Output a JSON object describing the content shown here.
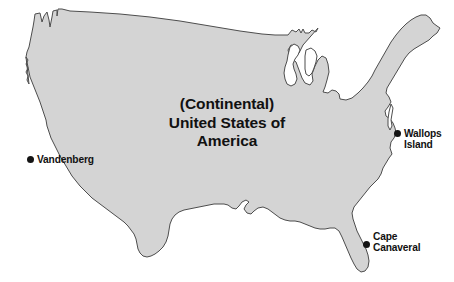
{
  "figure": {
    "kind": "map",
    "width": 454,
    "height": 282,
    "background_color": "#ffffff",
    "landmass_fill_color": "#d4d4d4",
    "landmass_outline_color": "#4d4d4d",
    "text_color": "#111111",
    "marker_color": "#141414"
  },
  "title": {
    "line1": "(Continental)",
    "line2": "United States of",
    "line3": "America"
  },
  "sites": [
    {
      "id": "vandenberg",
      "line1": "Vandenberg",
      "line2": "",
      "dot_side": "left"
    },
    {
      "id": "wallops",
      "line1": "Wallops",
      "line2": "Island",
      "dot_side": "left"
    },
    {
      "id": "canaveral",
      "line1": "Cape",
      "line2": "Canaveral",
      "dot_side": "left"
    }
  ]
}
